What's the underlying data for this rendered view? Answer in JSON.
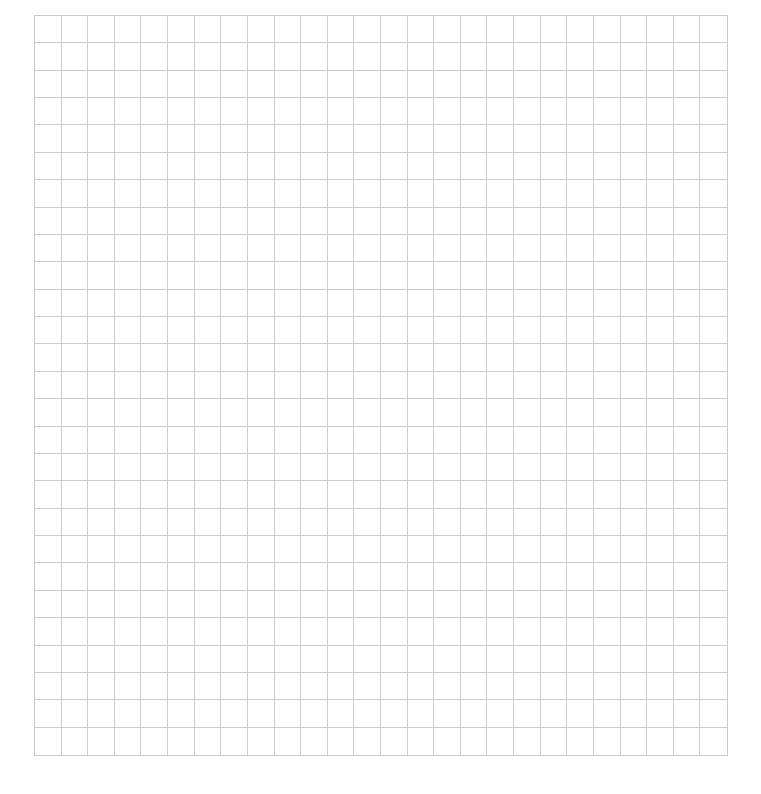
{
  "document": {
    "type": "graph-paper",
    "grid": {
      "columns": 26,
      "rows": 27,
      "line_color": "#cdcdcd",
      "background": "#ffffff"
    }
  }
}
